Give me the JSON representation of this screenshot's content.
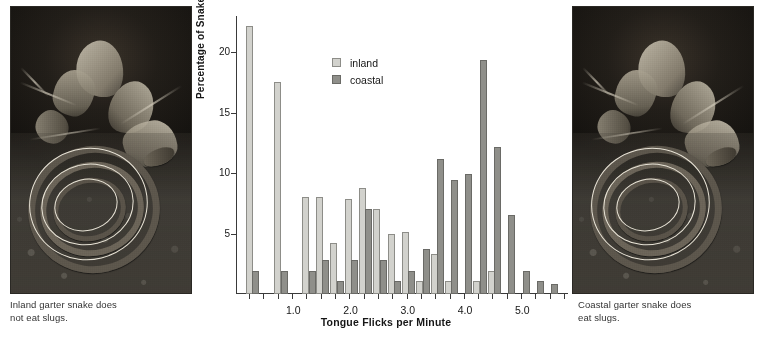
{
  "figure": {
    "left_photo": {
      "alt_name": "inland-garter-snake-photo",
      "caption_line1": "Inland garter snake does",
      "caption_line2": "not eat slugs."
    },
    "right_photo": {
      "alt_name": "coastal-garter-snake-photo",
      "caption_line1": "Coastal garter snake does",
      "caption_line2": "eat slugs."
    }
  },
  "chart_data": {
    "type": "bar",
    "title": "",
    "xlabel": "Tongue Flicks per Minute",
    "ylabel": "Percentage of Snakes",
    "xlim": [
      0.0,
      5.8
    ],
    "ylim": [
      0,
      23
    ],
    "xticks": [
      1.0,
      2.0,
      3.0,
      4.0,
      5.0
    ],
    "xtick_labels": [
      "1.0",
      "2.0",
      "3.0",
      "4.0",
      "5.0"
    ],
    "yticks": [
      5,
      10,
      15,
      20
    ],
    "ytick_labels": [
      "5",
      "10",
      "15",
      "20"
    ],
    "grid": false,
    "legend_position": "upper-center",
    "bin_width": 0.25,
    "bar_pair_offset": 0.11,
    "colors": {
      "inland": "#d2d2cd",
      "coastal": "#8f8f8a"
    },
    "series": [
      {
        "name": "inland",
        "label": "inland",
        "x": [
          0.23,
          0.73,
          1.22,
          1.46,
          1.71,
          1.96,
          2.21,
          2.46,
          2.71,
          2.96,
          3.21,
          3.46,
          3.71,
          3.96,
          4.21,
          4.46
        ],
        "values": [
          22.2,
          17.5,
          8.0,
          8.0,
          4.2,
          7.9,
          8.8,
          7.0,
          5.0,
          5.1,
          1.1,
          3.3,
          1.1,
          0.0,
          1.1,
          1.9
        ]
      },
      {
        "name": "coastal",
        "label": "coastal",
        "x": [
          0.34,
          0.84,
          1.33,
          1.57,
          1.82,
          2.07,
          2.32,
          2.57,
          2.82,
          3.07,
          3.32,
          3.57,
          3.82,
          4.07,
          4.32,
          4.57,
          4.82,
          5.07,
          5.32,
          5.57
        ],
        "values": [
          1.9,
          1.9,
          1.9,
          2.8,
          1.1,
          2.8,
          7.0,
          2.8,
          1.1,
          1.9,
          3.7,
          11.2,
          9.4,
          9.9,
          19.4,
          12.2,
          6.5,
          1.9,
          1.1,
          0.8
        ]
      }
    ]
  }
}
